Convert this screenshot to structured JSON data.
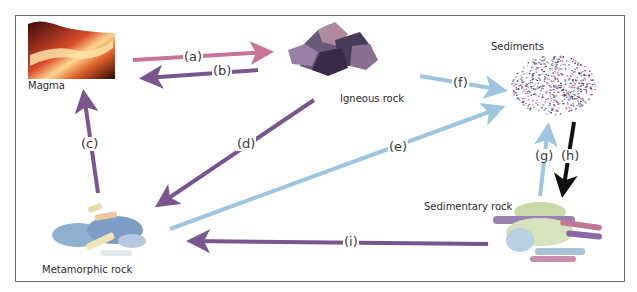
{
  "diagram": {
    "nodes": {
      "magma": {
        "label": "Magma"
      },
      "igneous": {
        "label": "Igneous rock"
      },
      "sediments": {
        "label": "Sediments"
      },
      "sedimentary": {
        "label": "Sedimentary rock"
      },
      "metamorphic": {
        "label": "Metamorphic rock"
      }
    },
    "arrows": [
      {
        "id": "a",
        "label": "(a)",
        "from": "Magma",
        "to": "Igneous rock",
        "color": "#c8739a"
      },
      {
        "id": "b",
        "label": "(b)",
        "from": "Igneous rock",
        "to": "Magma",
        "color": "#7a5590"
      },
      {
        "id": "c",
        "label": "(c)",
        "from": "Metamorphic rock",
        "to": "Magma",
        "color": "#7a5590"
      },
      {
        "id": "d",
        "label": "(d)",
        "from": "Igneous rock",
        "to": "Metamorphic rock",
        "color": "#7a5590"
      },
      {
        "id": "e",
        "label": "(e)",
        "from": "Metamorphic rock",
        "to": "Sediments",
        "color": "#9ec6e0"
      },
      {
        "id": "f",
        "label": "(f)",
        "from": "Igneous rock",
        "to": "Sediments",
        "color": "#9ec6e0"
      },
      {
        "id": "g",
        "label": "(g)",
        "from": "Sedimentary rock",
        "to": "Sediments",
        "color": "#9ec6e0"
      },
      {
        "id": "h",
        "label": "(h)",
        "from": "Sediments",
        "to": "Sedimentary rock",
        "color": "#111111"
      },
      {
        "id": "i",
        "label": "(i)",
        "from": "Sedimentary rock",
        "to": "Metamorphic rock",
        "color": "#7a5590"
      }
    ]
  }
}
